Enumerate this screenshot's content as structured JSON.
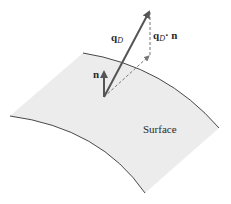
{
  "diagram": {
    "title": "",
    "surface": {
      "label": "Surface",
      "fill": "#ececec",
      "edge_color": "#333333"
    },
    "vectors": {
      "q_D": {
        "label_main": "q",
        "label_sub": "D",
        "color": "#555555"
      },
      "n": {
        "label": "n",
        "color": "#555555"
      }
    },
    "projection": {
      "label_main": "q",
      "label_sub": "D",
      "label_dot": "·",
      "label_n": "n",
      "style": "dashed"
    }
  }
}
